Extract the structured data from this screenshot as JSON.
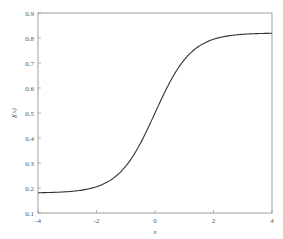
{
  "chart_data": {
    "type": "line",
    "title": "",
    "xlabel": "x",
    "ylabel": "f(x)",
    "xlim": [
      -4,
      4
    ],
    "ylim": [
      0.1,
      0.9
    ],
    "xticks": [
      "-4",
      "-2",
      "0",
      "2",
      "4"
    ],
    "yticks": [
      "0.1",
      "0.2",
      "0.3",
      "0.4",
      "0.5",
      "0.6",
      "0.7",
      "0.8",
      "0.9"
    ],
    "grid": false,
    "legend": null,
    "series": [
      {
        "name": "f(x)",
        "color": "#333333",
        "x": [
          -4,
          -3,
          -2,
          -1.5,
          -1,
          -0.5,
          0,
          0.5,
          1,
          1.5,
          2,
          3,
          4
        ],
        "y": [
          0.181,
          0.185,
          0.205,
          0.235,
          0.29,
          0.38,
          0.5,
          0.62,
          0.71,
          0.765,
          0.795,
          0.815,
          0.819
        ]
      }
    ]
  }
}
